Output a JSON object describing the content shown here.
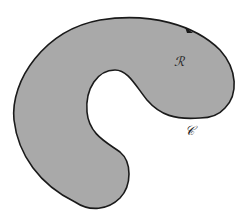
{
  "diagram": {
    "region_label": "ℛ",
    "curve_label": "𝒞",
    "colors": {
      "fill": "#a9a9a9",
      "stroke": "#1a1a1a",
      "background": "#ffffff"
    },
    "orientation_arrow": "counterclockwise"
  }
}
